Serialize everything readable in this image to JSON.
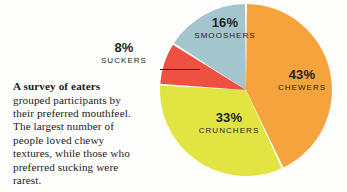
{
  "caption": {
    "lead": "A survey of eaters",
    "body": " grouped participants by their preferred mouthfeel. The largest number of people loved chewy textures, while those who preferred sucking were rarest."
  },
  "chart_data": {
    "type": "pie",
    "title": "",
    "legend_position": "on-slice",
    "unit": "%",
    "start_angle_deg": 0,
    "direction": "clockwise",
    "categories": [
      "CHEWERS",
      "CRUNCHERS",
      "SUCKERS",
      "SMOOSHERS"
    ],
    "values": [
      43,
      33,
      8,
      16
    ],
    "labels": [
      "43%",
      "33%",
      "8%",
      "16%"
    ],
    "colors": [
      "#F5A33C",
      "#E2E541",
      "#EE5042",
      "#A3C6CE"
    ],
    "slices": [
      {
        "name": "CHEWERS",
        "value": 43,
        "label": "43%",
        "color": "#F5A33C",
        "callout": false
      },
      {
        "name": "CRUNCHERS",
        "value": 33,
        "label": "33%",
        "color": "#E2E541",
        "callout": false
      },
      {
        "name": "SUCKERS",
        "value": 8,
        "label": "8%",
        "color": "#EE5042",
        "callout": true
      },
      {
        "name": "SMOOSHERS",
        "value": 16,
        "label": "16%",
        "color": "#A3C6CE",
        "callout": false
      }
    ]
  },
  "colors": {
    "background": "#fefefd",
    "text": "#231f20",
    "separator": "#ffffff",
    "leader_line": "#231f20"
  }
}
